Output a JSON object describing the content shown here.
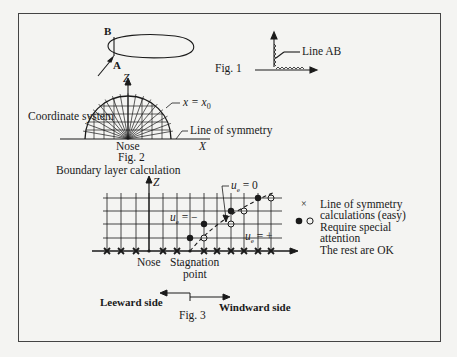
{
  "figure": {
    "fig1": {
      "caption": "Fig. 1",
      "point_b": "B",
      "point_a": "A",
      "line_label": "Line AB"
    },
    "fig2": {
      "caption": "Fig. 2",
      "title": "Coordinate system",
      "z_axis": "Z",
      "x_axis": "X",
      "nose": "Nose",
      "x_eq": "x = x",
      "x_eq_sub": "0",
      "symmetry": "Line of symmetry"
    },
    "fig3": {
      "caption": "Fig. 3",
      "title": "Boundary layer calculation",
      "z_axis": "Z",
      "ue_zero": "= 0",
      "ue_neg": "= −",
      "ue_pos": "= +",
      "ue": "u",
      "ue_sub": "e",
      "nose": "Nose",
      "stagnation_1": "Stagnation",
      "stagnation_2": "point",
      "leeward": "Leeward side",
      "windward": "Windward side",
      "legend": [
        {
          "symbol": "×",
          "line1": "Line of symmetry",
          "line2": "calculations (easy)"
        },
        {
          "symbol": "● ○",
          "line1": "Require special",
          "line2": "attention"
        },
        {
          "symbol": "",
          "line1": "The rest are OK",
          "line2": ""
        }
      ]
    }
  }
}
